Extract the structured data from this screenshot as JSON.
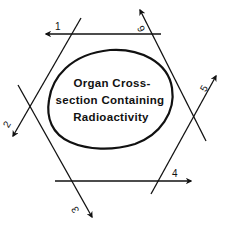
{
  "diagram": {
    "organ": {
      "label_lines": [
        "Organ Cross-",
        "section Containing",
        "Radioactivity"
      ]
    },
    "projections": [
      {
        "id": "1",
        "label": "1",
        "direction": "right-to-left"
      },
      {
        "id": "2",
        "label": "2",
        "direction": "upper-right-to-lower-left"
      },
      {
        "id": "3",
        "label": "3",
        "direction": "upper-left-to-lower-right"
      },
      {
        "id": "4",
        "label": "4",
        "direction": "left-to-right"
      },
      {
        "id": "5",
        "label": "5",
        "direction": "lower-left-to-upper-right"
      },
      {
        "id": "6",
        "label": "6",
        "direction": "lower-right-to-upper-left"
      }
    ],
    "colors": {
      "stroke": "#111111",
      "background": "#ffffff"
    }
  }
}
